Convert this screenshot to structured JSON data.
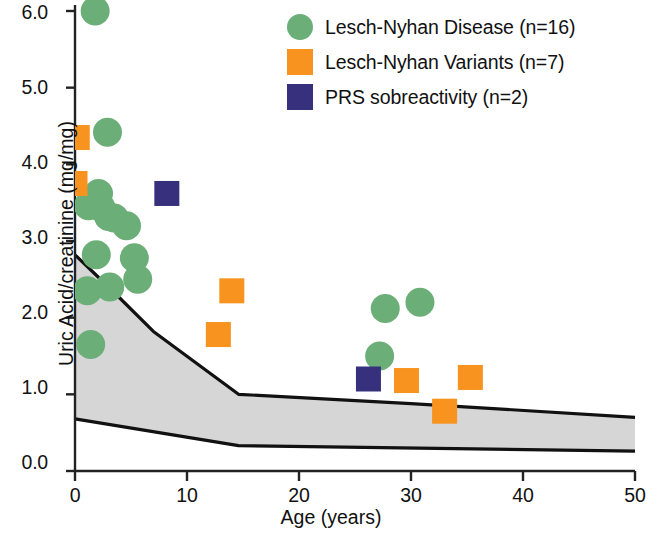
{
  "chart_data": {
    "type": "scatter",
    "title": "",
    "xlabel": "Age (years)",
    "ylabel": "Uric Acid/creatinine (mg/mg)",
    "xlim": [
      0,
      50
    ],
    "ylim": [
      0.0,
      6.0
    ],
    "xticks": [
      "0",
      "10",
      "20",
      "30",
      "40",
      "50"
    ],
    "xtick_values": [
      0,
      10,
      20,
      30,
      40,
      50
    ],
    "yticks": [
      "0.0",
      "1.0",
      "2.0",
      "3.0",
      "4.0",
      "5.0",
      "6.0"
    ],
    "ytick_values": [
      0.0,
      1.0,
      2.0,
      3.0,
      4.0,
      5.0,
      6.0
    ],
    "grid": false,
    "legend_position": "top-right",
    "series": [
      {
        "name": "Lesch-Nyhan Disease (n=16)",
        "marker": "circle",
        "color": "#6BAE78",
        "n": 16,
        "points": [
          {
            "x": 1.8,
            "y": 6.0
          },
          {
            "x": 2.9,
            "y": 4.42
          },
          {
            "x": 2.1,
            "y": 3.62
          },
          {
            "x": 1.2,
            "y": 3.46
          },
          {
            "x": 2.3,
            "y": 3.44
          },
          {
            "x": 3.0,
            "y": 3.32
          },
          {
            "x": 3.5,
            "y": 3.3
          },
          {
            "x": 4.6,
            "y": 3.2
          },
          {
            "x": 1.9,
            "y": 2.82
          },
          {
            "x": 5.3,
            "y": 2.78
          },
          {
            "x": 5.6,
            "y": 2.5
          },
          {
            "x": 1.1,
            "y": 2.35
          },
          {
            "x": 3.1,
            "y": 2.4
          },
          {
            "x": 1.4,
            "y": 1.65
          },
          {
            "x": 27.7,
            "y": 2.12
          },
          {
            "x": 30.8,
            "y": 2.2
          },
          {
            "x": 27.2,
            "y": 1.5
          }
        ]
      },
      {
        "name": "Lesch-Nyhan Variants (n=7)",
        "marker": "square",
        "color": "#F7931E",
        "n": 7,
        "points": [
          {
            "x": 0.2,
            "y": 4.35
          },
          {
            "x": 0.0,
            "y": 3.75
          },
          {
            "x": 14.0,
            "y": 2.35
          },
          {
            "x": 12.8,
            "y": 1.78
          },
          {
            "x": 29.6,
            "y": 1.18
          },
          {
            "x": 35.3,
            "y": 1.22
          },
          {
            "x": 33.0,
            "y": 0.78
          }
        ]
      },
      {
        "name": "PRS sobreactivity (n=2)",
        "marker": "square",
        "color": "#37307C",
        "n": 2,
        "points": [
          {
            "x": 8.2,
            "y": 3.62
          },
          {
            "x": 26.2,
            "y": 1.2
          }
        ]
      }
    ],
    "shaded_band": {
      "label": "normal reference range",
      "fill": "#d6d6d6",
      "upper": [
        {
          "x": 0,
          "y": 2.82
        },
        {
          "x": 3,
          "y": 2.4
        },
        {
          "x": 7.0,
          "y": 1.82
        },
        {
          "x": 14.6,
          "y": 1.0
        },
        {
          "x": 30,
          "y": 0.88
        },
        {
          "x": 50,
          "y": 0.7
        }
      ],
      "lower": [
        {
          "x": 0,
          "y": 0.68
        },
        {
          "x": 14.6,
          "y": 0.33
        },
        {
          "x": 50,
          "y": 0.26
        }
      ]
    }
  },
  "axes": {
    "y_title": "Uric Acid/creatinine (mg/mg)",
    "x_title": "Age (years)",
    "y_labels": [
      "6.0",
      "5.0",
      "4.0",
      "3.0",
      "2.0",
      "1.0",
      "0.0"
    ],
    "x_labels": [
      "0",
      "10",
      "20",
      "30",
      "40",
      "50"
    ]
  },
  "legend": {
    "items": [
      {
        "label": "Lesch-Nyhan Disease (n=16)",
        "color": "#6BAE78",
        "shape": "circle"
      },
      {
        "label": "Lesch-Nyhan Variants (n=7)",
        "color": "#F7931E",
        "shape": "square"
      },
      {
        "label": "PRS sobreactivity (n=2)",
        "color": "#37307C",
        "shape": "square"
      }
    ]
  },
  "colors": {
    "disease_green": "#6BAE78",
    "variant_orange": "#F7931E",
    "prs_purple": "#37307C",
    "band_gray": "#d6d6d6",
    "axis_black": "#222222"
  }
}
